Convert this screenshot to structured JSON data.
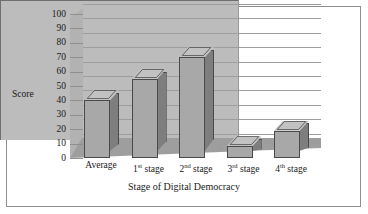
{
  "chart_data": {
    "type": "bar",
    "title": "",
    "xlabel": "Stage of Digital Democracy",
    "ylabel": "Score",
    "categories": [
      "Average",
      "1st stage",
      "2nd stage",
      "3rd stage",
      "4th stage"
    ],
    "category_parts": [
      {
        "main": "Average",
        "sup": "",
        "tail": ""
      },
      {
        "main": "1",
        "sup": "st",
        "tail": " stage"
      },
      {
        "main": "2",
        "sup": "nd",
        "tail": " stage"
      },
      {
        "main": "3",
        "sup": "rd",
        "tail": " stage"
      },
      {
        "main": "4",
        "sup": "th",
        "tail": " stage"
      }
    ],
    "values": [
      40,
      55,
      70,
      8,
      19
    ],
    "ylim": [
      0,
      100
    ],
    "ytick_step": 10,
    "yticks": [
      "100",
      "90",
      "80",
      "70",
      "60",
      "50",
      "40",
      "30",
      "20",
      "10",
      "0"
    ],
    "grid": true,
    "legend": "none",
    "style": "3d-column",
    "colors": {
      "bar_face": "#a8a8a8",
      "bar_side": "#7e7e7e",
      "bar_top": "#c2c2c2",
      "bar_outline": "#4a4a4a",
      "back_wall": "#bcbcbc",
      "side_wall": "#b2b2b2",
      "floor": "#9e9e9e",
      "gridline": "#9d9d9d",
      "frame_border": "#8e8e8e",
      "text": "#1a1a1a",
      "background": "#ffffff"
    }
  }
}
